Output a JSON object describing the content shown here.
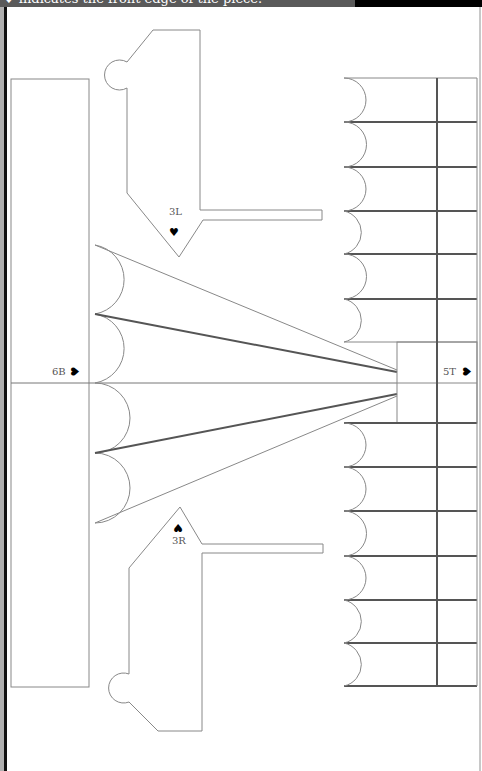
{
  "header": {
    "caption": "♥ indicates the front edge of the piece."
  },
  "pieces": [
    {
      "id": "3L",
      "label": "3L",
      "front_mark": "♥",
      "mark_orientation": "down"
    },
    {
      "id": "3R",
      "label": "3R",
      "front_mark": "♥",
      "mark_orientation": "up"
    },
    {
      "id": "6B",
      "label": "6B",
      "front_mark": "♥",
      "mark_orientation": "right"
    },
    {
      "id": "5T",
      "label": "5T",
      "front_mark": "♥",
      "mark_orientation": "right"
    }
  ],
  "colors": {
    "line": "#888888",
    "line_dark": "#555555",
    "header_bg": "#5a5a5a",
    "background": "#ffffff"
  }
}
